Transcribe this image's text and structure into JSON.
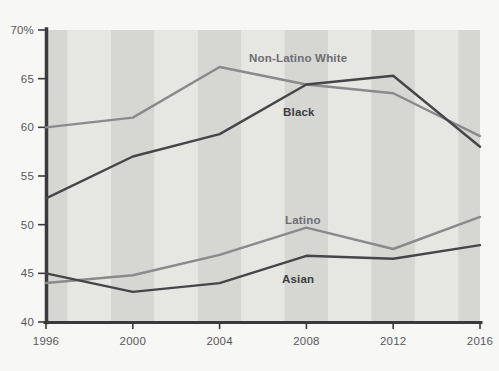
{
  "chart_data": {
    "type": "line",
    "title": "",
    "subtitle": "",
    "xlabel": "",
    "ylabel": "",
    "x": [
      1996,
      2000,
      2004,
      2008,
      2012,
      2016
    ],
    "xtick_labels": [
      "1996",
      "2000",
      "2004",
      "2008",
      "2012",
      "2016"
    ],
    "ytick_labels": [
      "70%",
      "65",
      "60",
      "55",
      "50",
      "45",
      "40"
    ],
    "yticks": [
      70,
      65,
      60,
      55,
      50,
      45,
      40
    ],
    "ylim": [
      40,
      70
    ],
    "xlim": [
      1996,
      2016
    ],
    "grid": false,
    "banded_background": true,
    "legend_position": "inline-labels",
    "series": [
      {
        "name": "Non-Latino White",
        "color": "#8a8a8d",
        "values": [
          60.0,
          61.0,
          66.2,
          64.4,
          63.5,
          59.1
        ]
      },
      {
        "name": "Black",
        "color": "#46464a",
        "values": [
          52.7,
          57.0,
          59.3,
          64.4,
          65.3,
          58.0
        ]
      },
      {
        "name": "Latino",
        "color": "#8a8a8d",
        "values": [
          44.0,
          44.8,
          46.9,
          49.7,
          47.5,
          50.8
        ]
      },
      {
        "name": "Asian",
        "color": "#46464a",
        "values": [
          45.0,
          43.1,
          44.0,
          46.8,
          46.5,
          47.9
        ]
      }
    ],
    "annotations": [
      {
        "text": "Non-Latino White",
        "series": "Non-Latino White",
        "tone": "light",
        "x": 249,
        "y": 62
      },
      {
        "text": "Black",
        "series": "Black",
        "tone": "dark",
        "x": 283,
        "y": 116
      },
      {
        "text": "Latino",
        "series": "Latino",
        "tone": "light",
        "x": 285,
        "y": 224
      },
      {
        "text": "Asian",
        "series": "Asian",
        "tone": "dark",
        "x": 282,
        "y": 283
      }
    ],
    "axis_color": "#3a3a3d",
    "band_color_light": "#e6e6e3",
    "band_color_dark": "#d6d6d2",
    "plot_background": "#e6e6e3"
  }
}
